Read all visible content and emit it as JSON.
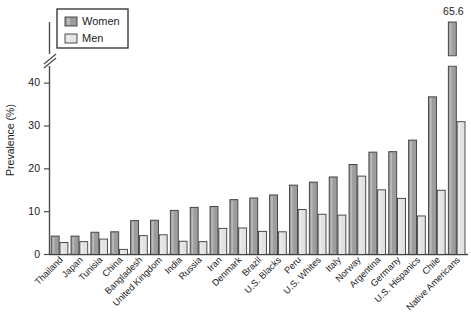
{
  "chart_data": {
    "type": "bar",
    "title": "",
    "xlabel": "",
    "ylabel": "Prevalence (%)",
    "ylim": [
      0,
      44
    ],
    "yticks": [
      0,
      10,
      20,
      30,
      40
    ],
    "grid": false,
    "legend_position": "top-left",
    "axis_break": {
      "present": true,
      "note": "y-axis broken above 44; tallest Women bar truncated and labeled with its value"
    },
    "annotations": [
      {
        "text": "65.6",
        "series": "Women",
        "category": "Native Americans"
      }
    ],
    "categories": [
      "Thailand",
      "Japan",
      "Tunisia",
      "China",
      "Bangladesh",
      "United Kingdom",
      "India",
      "Russia",
      "Iran",
      "Denmark",
      "Brazil",
      "U.S. Blacks",
      "Peru",
      "U.S. Whites",
      "Italy",
      "Norway",
      "Argentina",
      "Germany",
      "U.S. Hispanics",
      "Chile",
      "Native Americans"
    ],
    "series": [
      {
        "name": "Women",
        "color": "#9d9d9d",
        "values": [
          4.3,
          4.3,
          5.2,
          5.3,
          7.9,
          8.0,
          10.3,
          11.0,
          11.2,
          12.8,
          13.2,
          13.9,
          16.2,
          16.9,
          18.1,
          21.0,
          23.9,
          24.0,
          26.7,
          36.8,
          65.6
        ]
      },
      {
        "name": "Men",
        "color": "#e2e2e2",
        "values": [
          2.8,
          3.0,
          3.6,
          1.2,
          4.4,
          4.6,
          3.1,
          3.0,
          6.1,
          6.2,
          5.4,
          5.3,
          10.5,
          9.4,
          9.2,
          18.3,
          15.1,
          13.1,
          9.0,
          15.0,
          31.0
        ]
      }
    ]
  },
  "legend": {
    "items": [
      {
        "label": "Women",
        "swatch": "#9d9d9d"
      },
      {
        "label": "Men",
        "swatch": "#e2e2e2"
      }
    ]
  },
  "axes": {
    "y_title": "Prevalence (%)",
    "y_tick_labels": [
      "0",
      "10",
      "20",
      "30",
      "40"
    ]
  }
}
